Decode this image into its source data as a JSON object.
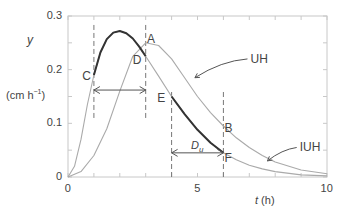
{
  "chart_data": {
    "type": "line",
    "title": "",
    "xlabel": "t (h)",
    "ylabel": "y",
    "ylabel_units": "(cm h⁻¹)",
    "xlim": [
      0,
      10
    ],
    "ylim": [
      0,
      0.3
    ],
    "xticks": [
      0,
      5,
      10
    ],
    "xtick_labels": [
      "0",
      "5",
      "10"
    ],
    "yticks": [
      0,
      0.1,
      0.2,
      0.3
    ],
    "ytick_labels": [
      "0",
      "0.1",
      "0.2",
      "0.3"
    ],
    "grid": false,
    "series": [
      {
        "name": "IUH",
        "color": "#aaaaaa",
        "x": [
          0,
          0.25,
          0.5,
          0.75,
          1,
          1.25,
          1.5,
          1.75,
          2,
          2.25,
          2.5,
          2.75,
          3,
          3.5,
          4,
          4.5,
          5,
          5.5,
          6,
          6.5,
          7,
          7.5,
          8,
          9,
          10
        ],
        "y": [
          0,
          0.02,
          0.07,
          0.135,
          0.19,
          0.232,
          0.257,
          0.269,
          0.272,
          0.268,
          0.258,
          0.243,
          0.225,
          0.188,
          0.15,
          0.117,
          0.088,
          0.064,
          0.045,
          0.032,
          0.022,
          0.015,
          0.01,
          0.004,
          0.002
        ]
      },
      {
        "name": "UH",
        "color": "#aaaaaa",
        "x": [
          0,
          0.5,
          1,
          1.5,
          2,
          2.5,
          3,
          3.5,
          4,
          4.5,
          5,
          5.5,
          6,
          6.5,
          7,
          7.5,
          8,
          9,
          10
        ],
        "y": [
          0,
          0.01,
          0.04,
          0.09,
          0.16,
          0.225,
          0.25,
          0.245,
          0.22,
          0.185,
          0.15,
          0.12,
          0.095,
          0.073,
          0.055,
          0.04,
          0.028,
          0.013,
          0.006
        ]
      },
      {
        "name": "IUH segment C-D",
        "color": "#333333",
        "x": [
          1,
          1.25,
          1.5,
          1.75,
          2,
          2.25,
          2.5,
          2.75,
          3
        ],
        "y": [
          0.19,
          0.232,
          0.257,
          0.269,
          0.272,
          0.268,
          0.258,
          0.243,
          0.225
        ]
      },
      {
        "name": "IUH segment E-F",
        "color": "#333333",
        "x": [
          4,
          4.5,
          5,
          5.5,
          6
        ],
        "y": [
          0.15,
          0.117,
          0.088,
          0.064,
          0.045
        ]
      }
    ],
    "vlines": [
      {
        "x": 1,
        "y0": 0.11,
        "y1": 0.285
      },
      {
        "x": 3,
        "y0": 0.11,
        "y1": 0.285
      },
      {
        "x": 4,
        "y0": 0.0,
        "y1": 0.16
      },
      {
        "x": 6,
        "y0": 0.0,
        "y1": 0.16
      }
    ],
    "arrows": [
      {
        "x0": 1,
        "x1": 3,
        "y": 0.162,
        "label": ""
      },
      {
        "x0": 4,
        "x1": 6,
        "y": 0.045,
        "label": "D_u"
      }
    ],
    "annotations": [
      {
        "text": "A",
        "x": 3.2,
        "y": 0.258
      },
      {
        "text": "B",
        "x": 6.2,
        "y": 0.092
      },
      {
        "text": "C",
        "x": 0.7,
        "y": 0.188
      },
      {
        "text": "D",
        "x": 2.65,
        "y": 0.218
      },
      {
        "text": "E",
        "x": 3.6,
        "y": 0.148
      },
      {
        "text": "F",
        "x": 6.2,
        "y": 0.036
      },
      {
        "text": "UH",
        "x": 7.2,
        "y": 0.22,
        "arrow_to": [
          4.9,
          0.185
        ]
      },
      {
        "text": "IUH",
        "x": 9.1,
        "y": 0.055,
        "arrow_to": [
          7.7,
          0.03
        ]
      }
    ]
  },
  "labels": {
    "y_axis_symbol": "y",
    "y_axis_units_main": "(cm h",
    "y_axis_units_sup": "−1",
    "y_axis_units_close": ")",
    "x_axis_symbol": "t",
    "x_axis_units": " (h)",
    "du_main": "D",
    "du_sub": "u"
  }
}
